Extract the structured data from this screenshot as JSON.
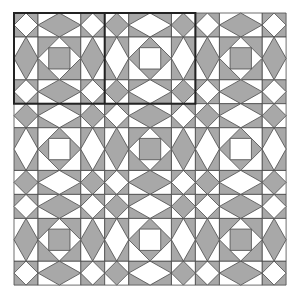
{
  "diagram": {
    "type": "quilt-pattern",
    "grid": {
      "rows": 3,
      "cols": 3,
      "origin_x": 14,
      "origin_y": 13,
      "block_size": 90.7
    },
    "block_layout": [
      [
        "A",
        "B",
        "A"
      ],
      [
        "B",
        "A",
        "B"
      ],
      [
        "A",
        "B",
        "A"
      ]
    ],
    "highlight": {
      "row": 0,
      "col_start": 0,
      "col_end": 1,
      "stroke_width": 2
    },
    "colors": {
      "fill": "#a8a8a8",
      "background": "#ffffff",
      "line": "#4a4a4a",
      "highlight": "#222222"
    },
    "block_types": {
      "A": "gray center square, white diamond corners, gray diamond bands",
      "B": "white center square, gray diamond corners, white diamond bands"
    }
  }
}
